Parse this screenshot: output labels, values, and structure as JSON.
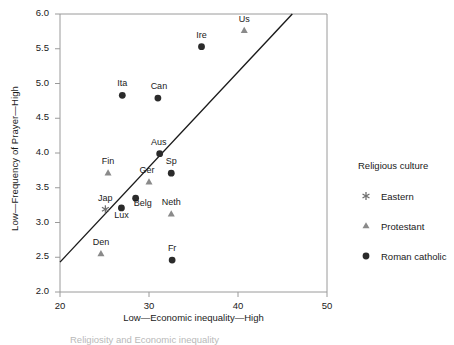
{
  "chart_data": {
    "type": "scatter",
    "title": "",
    "xlabel": "Low—Economic inequality—High",
    "ylabel": "Low—Frequency of Prayer—High",
    "xlim": [
      20,
      50
    ],
    "ylim": [
      2.0,
      6.0
    ],
    "xticks": [
      "20",
      "30",
      "40",
      "50"
    ],
    "xtick_values": [
      20,
      30,
      40,
      50
    ],
    "yticks": [
      "2.0",
      "2.5",
      "3.0",
      "3.5",
      "4.0",
      "4.5",
      "5.0",
      "5.5",
      "6.0"
    ],
    "ytick_values": [
      2.0,
      2.5,
      3.0,
      3.5,
      4.0,
      4.5,
      5.0,
      5.5,
      6.0
    ],
    "grid": false,
    "legend_position": "right",
    "legend_title": "Religious culture",
    "legend_entries": [
      {
        "label": "Eastern",
        "marker": "asterisk",
        "color": "#6f6f6f"
      },
      {
        "label": "Protestant",
        "marker": "triangle",
        "color": "#8a8a8a"
      },
      {
        "label": "Roman catholic",
        "marker": "circle",
        "color": "#2b2b2b"
      }
    ],
    "trendline": {
      "x0": 20,
      "y0": 2.43,
      "x1": 46.1,
      "y1": 6.0,
      "color": "#1a1a1a"
    },
    "points": [
      {
        "name": "Us",
        "x": 40.7,
        "y": 5.76,
        "group": "Protestant",
        "label_dx": 0,
        "label_dy": -12
      },
      {
        "name": "Ire",
        "x": 35.9,
        "y": 5.53,
        "group": "Roman catholic",
        "label_dx": 0,
        "label_dy": -12
      },
      {
        "name": "Ita",
        "x": 27.0,
        "y": 4.83,
        "group": "Roman catholic",
        "label_dx": 0,
        "label_dy": -12
      },
      {
        "name": "Can",
        "x": 31.0,
        "y": 4.79,
        "group": "Roman catholic",
        "label_dx": 1,
        "label_dy": -12
      },
      {
        "name": "Aus",
        "x": 31.2,
        "y": 3.99,
        "group": "Roman catholic",
        "label_dx": -1,
        "label_dy": -12
      },
      {
        "name": "Fin",
        "x": 25.4,
        "y": 3.71,
        "group": "Protestant",
        "label_dx": 0,
        "label_dy": -12
      },
      {
        "name": "Sp",
        "x": 32.5,
        "y": 3.71,
        "group": "Roman catholic",
        "label_dx": 0,
        "label_dy": -12
      },
      {
        "name": "Ger",
        "x": 30.0,
        "y": 3.58,
        "group": "Protestant",
        "label_dx": -2,
        "label_dy": -12
      },
      {
        "name": "Belg",
        "x": 28.5,
        "y": 3.35,
        "group": "Roman catholic",
        "label_dx": 7,
        "label_dy": 5
      },
      {
        "name": "Lux",
        "x": 26.9,
        "y": 3.21,
        "group": "Roman catholic",
        "label_dx": 0,
        "label_dy": 7
      },
      {
        "name": "Jap",
        "x": 25.1,
        "y": 3.19,
        "group": "Eastern",
        "label_dx": 0,
        "label_dy": -11
      },
      {
        "name": "Neth",
        "x": 32.5,
        "y": 3.12,
        "group": "Protestant",
        "label_dx": 0,
        "label_dy": -12
      },
      {
        "name": "Den",
        "x": 24.6,
        "y": 2.55,
        "group": "Protestant",
        "label_dx": 0,
        "label_dy": -12
      },
      {
        "name": "Fr",
        "x": 32.6,
        "y": 2.46,
        "group": "Roman catholic",
        "label_dx": 0,
        "label_dy": -12
      }
    ]
  },
  "caption": "Religiosity and Economic inequality",
  "colors": {
    "axis": "#9a9a9a",
    "text": "#1a1a1a",
    "protestant": "#8a8a8a",
    "eastern": "#6f6f6f",
    "catholic": "#2b2b2b",
    "trendline": "#1a1a1a"
  }
}
